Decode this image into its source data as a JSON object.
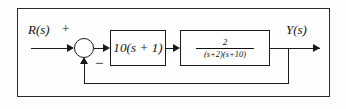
{
  "figure": {
    "kind": "control-system-block-diagram",
    "background_color": "#fdfdfd",
    "line_color": "#1a1a1a",
    "frame_color": "#2a2a2a"
  },
  "signals": {
    "input_label": "R(s)",
    "output_label": "Y(s)"
  },
  "summing_junction": {
    "positive_sign": "+",
    "negative_sign": "−"
  },
  "blocks": {
    "gain": {
      "expression": "10(s + 1)"
    },
    "plant": {
      "numerator": "2",
      "denominator": "(s+2)(s+10)"
    }
  },
  "feedback": {
    "type": "unity",
    "label": ""
  }
}
